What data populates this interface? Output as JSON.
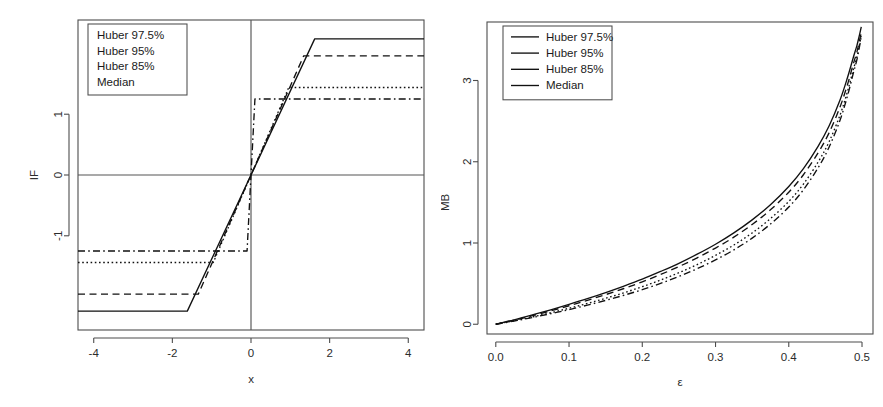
{
  "figure": {
    "panels": [
      "influence-function",
      "maximum-bias"
    ]
  },
  "chart_data": [
    {
      "type": "line",
      "id": "influence-function",
      "title": "",
      "xlabel": "x",
      "ylabel": "IF",
      "xlim": [
        -4.4,
        4.4
      ],
      "ylim": [
        -2.55,
        2.55
      ],
      "xticks": [
        "-4",
        "-2",
        "0",
        "2",
        "4"
      ],
      "xtick_values": [
        -4,
        -2,
        0,
        2,
        4
      ],
      "yticks": [
        "-1",
        "0",
        "1"
      ],
      "ytick_values": [
        -1,
        0,
        1
      ],
      "grid": false,
      "zero_lines": true,
      "legend_position": "top-left",
      "legend_has_samples": false,
      "description": "Huber psi (influence) functions: linear through the origin then clipped at a constant plateau; the Median influence function is a near-vertical step.",
      "series": [
        {
          "name": "Huber 97.5%",
          "style": "solid",
          "knee_x": 1.62,
          "plateau": 2.24,
          "points_x": [
            -4.4,
            -1.62,
            0,
            1.62,
            4.4
          ],
          "points_y": [
            -2.24,
            -2.24,
            0,
            2.24,
            2.24
          ]
        },
        {
          "name": "Huber 95%",
          "style": "dashed",
          "knee_x": 1.34,
          "plateau": 1.96,
          "points_x": [
            -4.4,
            -1.34,
            0,
            1.34,
            4.4
          ],
          "points_y": [
            -1.96,
            -1.96,
            0,
            1.96,
            1.96
          ]
        },
        {
          "name": "Huber 85%",
          "style": "dotted",
          "knee_x": 0.96,
          "plateau": 1.44,
          "points_x": [
            -4.4,
            -0.96,
            0,
            0.96,
            4.4
          ],
          "points_y": [
            -1.44,
            -1.44,
            0,
            1.44,
            1.44
          ]
        },
        {
          "name": "Median",
          "style": "dashdot",
          "knee_x": 0.1,
          "plateau": 1.25,
          "points_x": [
            -4.4,
            -0.1,
            0,
            0.1,
            4.4
          ],
          "points_y": [
            -1.25,
            -1.25,
            0,
            1.25,
            1.25
          ]
        }
      ]
    },
    {
      "type": "line",
      "id": "maximum-bias",
      "title": "",
      "xlabel": "ε",
      "ylabel": "MB",
      "xlim": [
        -0.012,
        0.515
      ],
      "ylim": [
        -0.12,
        3.72
      ],
      "xticks": [
        "0.0",
        "0.1",
        "0.2",
        "0.3",
        "0.4",
        "0.5"
      ],
      "xtick_values": [
        0.0,
        0.1,
        0.2,
        0.3,
        0.4,
        0.5
      ],
      "yticks": [
        "0",
        "1",
        "2",
        "3"
      ],
      "ytick_values": [
        0,
        1,
        2,
        3
      ],
      "grid": false,
      "zero_lines": false,
      "legend_position": "top-left",
      "legend_has_samples": true,
      "description": "Maximum bias curves as a function of the contamination fraction epsilon; all start at the origin and diverge as epsilon approaches 0.5.",
      "x": [
        0.0,
        0.025,
        0.05,
        0.075,
        0.1,
        0.125,
        0.15,
        0.175,
        0.2,
        0.225,
        0.25,
        0.275,
        0.3,
        0.325,
        0.35,
        0.375,
        0.4,
        0.42,
        0.44,
        0.455,
        0.47,
        0.48,
        0.488,
        0.493,
        0.496,
        0.498,
        0.499
      ],
      "series": [
        {
          "name": "Huber 97.5%",
          "style": "solid",
          "values": [
            0.0,
            0.055,
            0.115,
            0.178,
            0.245,
            0.315,
            0.39,
            0.47,
            0.555,
            0.65,
            0.75,
            0.862,
            0.985,
            1.125,
            1.285,
            1.47,
            1.695,
            1.915,
            2.19,
            2.44,
            2.76,
            3.03,
            3.28,
            3.43,
            3.54,
            3.62,
            3.66
          ]
        },
        {
          "name": "Huber 95%",
          "style": "dashed",
          "values": [
            0.0,
            0.05,
            0.105,
            0.165,
            0.228,
            0.295,
            0.365,
            0.44,
            0.522,
            0.612,
            0.71,
            0.818,
            0.938,
            1.072,
            1.228,
            1.408,
            1.625,
            1.84,
            2.11,
            2.355,
            2.675,
            2.945,
            3.2,
            3.35,
            3.47,
            3.55,
            3.6
          ]
        },
        {
          "name": "Huber 85%",
          "style": "dotted",
          "values": [
            0.0,
            0.043,
            0.09,
            0.142,
            0.197,
            0.256,
            0.32,
            0.388,
            0.462,
            0.544,
            0.634,
            0.735,
            0.848,
            0.975,
            1.124,
            1.3,
            1.512,
            1.725,
            1.995,
            2.245,
            2.575,
            2.86,
            3.13,
            3.29,
            3.42,
            3.51,
            3.57
          ]
        },
        {
          "name": "Median",
          "style": "dashdot",
          "values": [
            0.0,
            0.04,
            0.083,
            0.13,
            0.18,
            0.235,
            0.294,
            0.357,
            0.426,
            0.503,
            0.588,
            0.684,
            0.792,
            0.915,
            1.06,
            1.233,
            1.442,
            1.655,
            1.925,
            2.178,
            2.512,
            2.805,
            3.085,
            3.255,
            3.39,
            3.49,
            3.55
          ]
        }
      ]
    }
  ],
  "legends": {
    "influence_function": {
      "items": [
        "Huber 97.5%",
        "Huber 95%",
        "Huber 85%",
        "Median"
      ]
    },
    "maximum_bias": {
      "items": [
        {
          "label": "Huber 97.5%",
          "style": "solid"
        },
        {
          "label": "Huber 95%",
          "style": "dashed"
        },
        {
          "label": "Huber 85%",
          "style": "dotted"
        },
        {
          "label": "Median",
          "style": "dashdot"
        }
      ]
    }
  }
}
